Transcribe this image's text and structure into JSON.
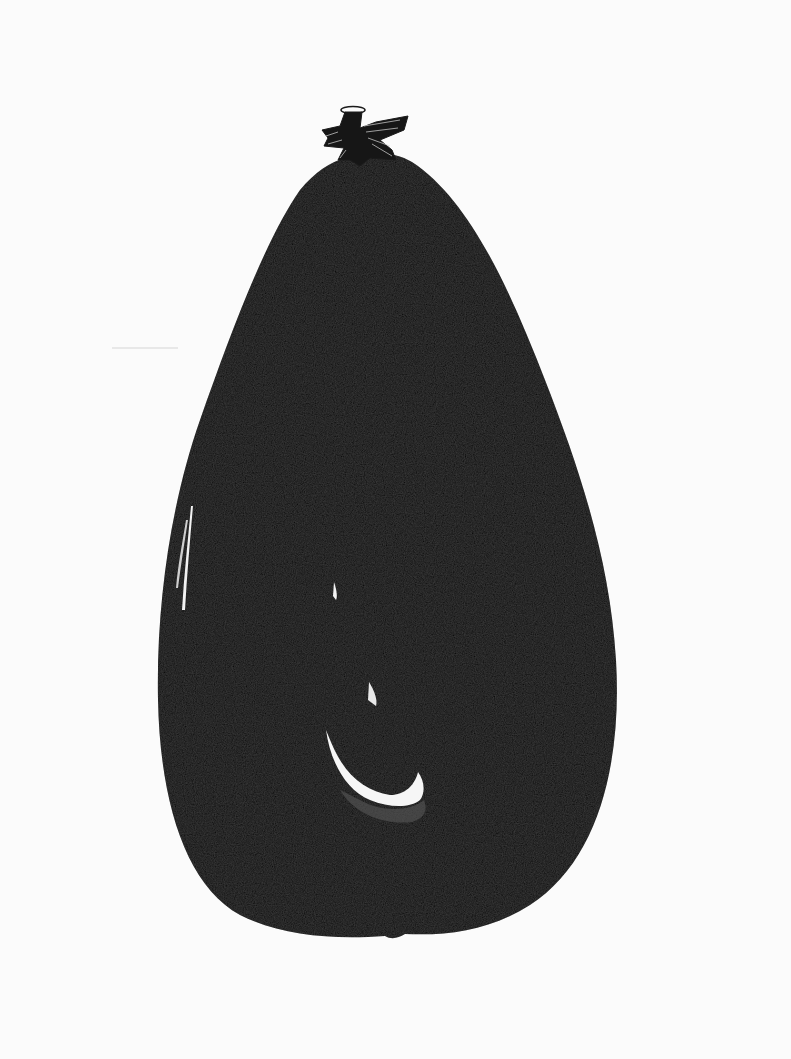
{
  "image": {
    "subject": "Ink drawing of an eggplant",
    "width": 791,
    "height": 1059,
    "colors": {
      "paper": "#fbfbfb",
      "ink": "#0d0d0d",
      "highlight": "#f4f4f4",
      "calyx_stroke": "#d8d8d8"
    }
  },
  "elements": {
    "body": {
      "label": "eggplant-body"
    },
    "calyx": {
      "label": "eggplant-calyx-stem"
    },
    "highlight_center": {
      "label": "center-reflection"
    },
    "highlight_left": {
      "label": "left-edge-reflection"
    }
  }
}
